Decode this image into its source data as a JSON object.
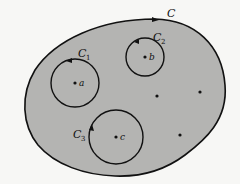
{
  "diagram": {
    "colors": {
      "region_fill": "#b4b4b2",
      "stroke": "#111111",
      "background": "#f7f7f5"
    },
    "outer_contour": {
      "label": "C",
      "sub": ""
    },
    "circles": [
      {
        "id": "c1",
        "label": "C",
        "sub": "1",
        "point_label": "a",
        "cx": 75,
        "cy": 83,
        "r": 24
      },
      {
        "id": "c2",
        "label": "C",
        "sub": "2",
        "point_label": "b",
        "cx": 145,
        "cy": 57,
        "r": 19
      },
      {
        "id": "c3",
        "label": "C",
        "sub": "3",
        "point_label": "c",
        "cx": 116,
        "cy": 137,
        "r": 27
      }
    ],
    "extra_points": [
      {
        "x": 157,
        "y": 96
      },
      {
        "x": 200,
        "y": 92
      },
      {
        "x": 180,
        "y": 135
      }
    ]
  }
}
